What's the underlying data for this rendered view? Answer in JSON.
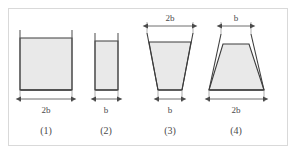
{
  "figure": {
    "frame_border_color": "#d9d9d9",
    "background": "#ffffff",
    "outline_color": "#3d3d3d",
    "fill_color": "#e9e9e9",
    "dimension_color": "#4a4a4a"
  },
  "shapes": [
    {
      "id": "shape-1",
      "caption": "(1)",
      "type": "rectangle",
      "top_width_label": "",
      "bottom_width_label": "2b",
      "has_top_dimension": false,
      "has_bottom_dimension": true
    },
    {
      "id": "shape-2",
      "caption": "(2)",
      "type": "rectangle",
      "top_width_label": "",
      "bottom_width_label": "b",
      "has_top_dimension": false,
      "has_bottom_dimension": true
    },
    {
      "id": "shape-3",
      "caption": "(3)",
      "type": "trapezoid-wide-top",
      "top_width_label": "2b",
      "bottom_width_label": "b",
      "has_top_dimension": true,
      "has_bottom_dimension": true
    },
    {
      "id": "shape-4",
      "caption": "(4)",
      "type": "trapezoid-narrow-top",
      "top_width_label": "b",
      "bottom_width_label": "2b",
      "has_top_dimension": true,
      "has_bottom_dimension": true
    }
  ],
  "labels": {
    "s1_bottom": "2b",
    "s1_caption": "(1)",
    "s2_bottom": "b",
    "s2_caption": "(2)",
    "s3_top": "2b",
    "s3_bottom": "b",
    "s3_caption": "(3)",
    "s4_top": "b",
    "s4_bottom": "2b",
    "s4_caption": "(4)"
  }
}
